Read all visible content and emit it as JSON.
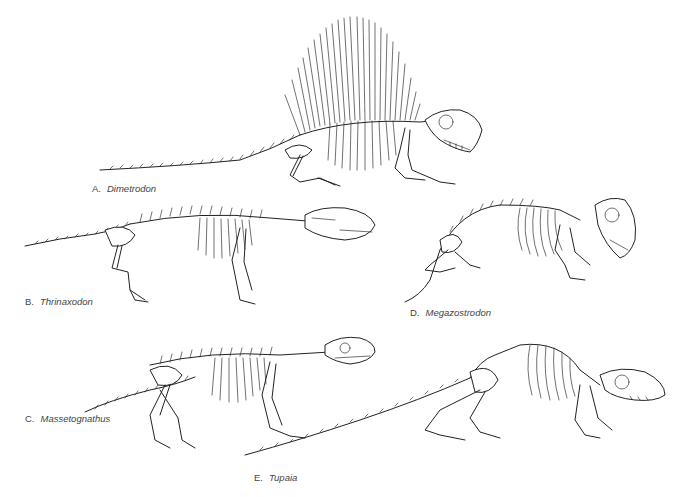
{
  "figure": {
    "specimens": [
      {
        "id": "A",
        "letter": "A.",
        "name": "Dimetrodon"
      },
      {
        "id": "B",
        "letter": "B.",
        "name": "Thrinaxodon"
      },
      {
        "id": "C",
        "letter": "C.",
        "name": "Massetognathus"
      },
      {
        "id": "D",
        "letter": "D.",
        "name": "Megazostrodon"
      },
      {
        "id": "E",
        "letter": "E.",
        "name": "Tupaia"
      }
    ]
  }
}
